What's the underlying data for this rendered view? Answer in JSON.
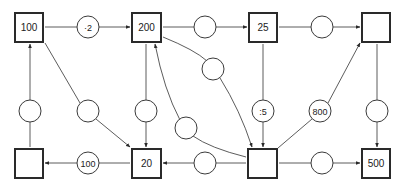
{
  "diagram": {
    "type": "arithmetic-arrow-puzzle",
    "boxes": {
      "top_1": {
        "value": "100"
      },
      "top_2": {
        "value": "200"
      },
      "top_3": {
        "value": "25"
      },
      "top_4": {
        "value": ""
      },
      "bottom_1": {
        "value": ""
      },
      "bottom_2": {
        "value": "20"
      },
      "bottom_3": {
        "value": ""
      },
      "bottom_4": {
        "value": "500"
      }
    },
    "operators": {
      "top_1_to_top_2": {
        "label": "·2"
      },
      "top_2_to_top_3": {
        "label": ""
      },
      "top_3_to_top_4": {
        "label": ""
      },
      "bottom_1_to_top_1": {
        "label": ""
      },
      "top_1_to_bottom_2": {
        "label": ""
      },
      "top_2_to_bottom_2": {
        "label": ""
      },
      "top_2_to_bottom_3": {
        "label": ""
      },
      "bottom_3_to_top_2": {
        "label": ""
      },
      "top_3_to_bottom_3": {
        "label": ":5"
      },
      "bottom_3_to_top_4": {
        "label": "800"
      },
      "top_4_to_bottom_4": {
        "label": ""
      },
      "bottom_2_to_bottom_1": {
        "label": "100"
      },
      "bottom_3_to_bottom_2": {
        "label": ""
      },
      "bottom_3_to_bottom_4": {
        "label": ""
      }
    }
  }
}
